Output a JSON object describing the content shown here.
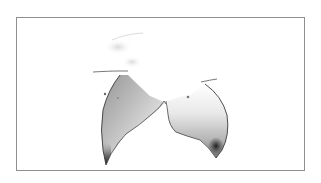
{
  "image": {
    "description": "Grayscale anatomical illustration of two rounded shapes within a thin gray frame",
    "background_color": "#ffffff",
    "frame_color": "#8f8f8f",
    "shade_dark": "#2a2a2a",
    "shade_mid": "#9a9a9a",
    "shade_light": "#e6e6e6"
  }
}
